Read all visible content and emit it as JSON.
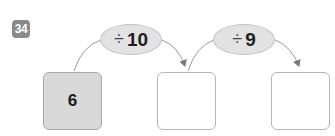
{
  "problem": {
    "number": "34",
    "top_text_partial": "ㅡㅡㅡㅡㅡㅡ ㅡㅡㅡㅡ ㅡㅡ ㅡㅡ"
  },
  "operations": [
    {
      "symbol": "÷",
      "value": "10"
    },
    {
      "symbol": "÷",
      "value": "9"
    }
  ],
  "boxes": [
    {
      "value": "6",
      "filled": true
    },
    {
      "value": "",
      "filled": false
    },
    {
      "value": "",
      "filled": false
    }
  ],
  "colors": {
    "badge": "#8a8a8a",
    "oval_fill": "#e2e2e2",
    "filled_box": "#d9d9d9",
    "arrow": "#8c8c8c"
  }
}
